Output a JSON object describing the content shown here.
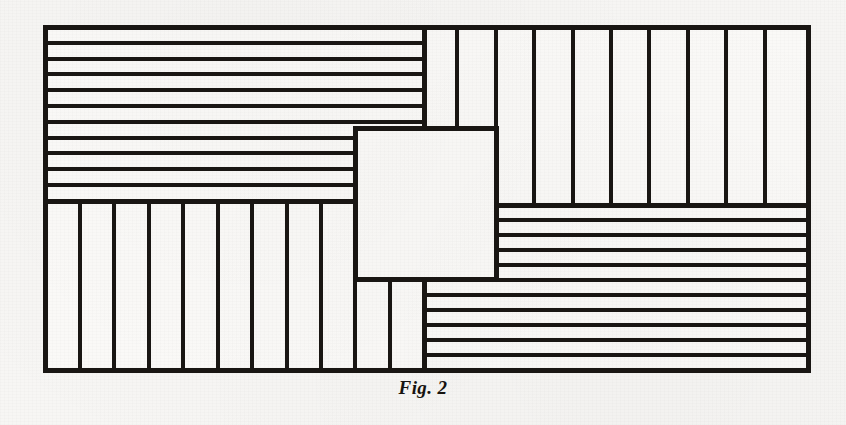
{
  "figure": {
    "caption": "Fig. 2",
    "ink_color": "#191613",
    "paper_color": "#f7f6f4",
    "fill_color": "#fbfaf8",
    "frame": {
      "x": 45,
      "y": 27,
      "width": 763,
      "height": 343,
      "stroke_width": 5
    },
    "center_square": {
      "x": 355,
      "y": 128,
      "width": 141,
      "height": 151,
      "stroke_width": 5
    },
    "strip_stroke_width": 4,
    "regions": [
      {
        "name": "top-left-horizontal-strips",
        "orientation": "horizontal",
        "x": 45,
        "y": 27,
        "width": 379,
        "height": 174,
        "count": 11
      },
      {
        "name": "top-right-vertical-strips",
        "orientation": "vertical",
        "x": 424,
        "y": 27,
        "width": 384,
        "height": 178,
        "count": 10,
        "note": "two leftmost strips are cut short at the top of the center square"
      },
      {
        "name": "bottom-right-horizontal-strips",
        "orientation": "horizontal",
        "x": 424,
        "y": 205,
        "width": 384,
        "height": 165,
        "count": 11,
        "note": "upper strips start at the right edge of the center square"
      },
      {
        "name": "bottom-left-vertical-strips",
        "orientation": "vertical",
        "x": 45,
        "y": 201,
        "width": 379,
        "height": 169,
        "count": 11,
        "note": "two rightmost strips are cut short beneath the center square"
      }
    ]
  }
}
